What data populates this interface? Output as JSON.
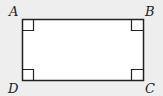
{
  "diagram": {
    "shape": "rectangle",
    "vertices": [
      {
        "label": "A",
        "position": "top-left"
      },
      {
        "label": "B",
        "position": "top-right"
      },
      {
        "label": "C",
        "position": "bottom-right"
      },
      {
        "label": "D",
        "position": "bottom-left"
      }
    ],
    "right_angle_markers": 4,
    "colors": {
      "background": "#eeeeee",
      "fill": "#ffffff",
      "stroke": "#222222"
    }
  }
}
